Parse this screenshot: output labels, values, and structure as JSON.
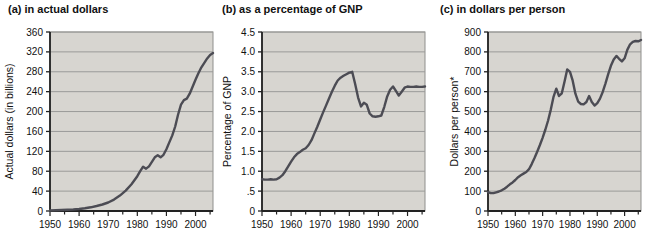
{
  "colors": {
    "page_bg": "#ffffff",
    "plot_bg": "#d7d5d0",
    "grid": "#9b9b99",
    "plot_border": "#8f8f8d",
    "axis": "#222222",
    "line": "#4c4c54",
    "text": "#111111"
  },
  "chart_data": [
    {
      "type": "line",
      "title": "(a) in actual dollars",
      "ylabel": "Actual dollars (in billions)",
      "xlabel": "",
      "ylim": [
        0,
        360
      ],
      "y_ticks": [
        0,
        40,
        80,
        120,
        160,
        200,
        240,
        280,
        320,
        360
      ],
      "y_tick_labels": [
        "0",
        "40",
        "80",
        "120",
        "160",
        "200",
        "240",
        "280",
        "320",
        "360"
      ],
      "x_domain": [
        1950,
        2006
      ],
      "x_tick_minor_step": 5,
      "x_tick_labels": [
        "1950",
        "1960",
        "1970",
        "1980",
        "1990",
        "2000"
      ],
      "grid": "horizontal",
      "legend": "none",
      "points": [
        [
          1950,
          1
        ],
        [
          1952,
          1.5
        ],
        [
          1954,
          2
        ],
        [
          1956,
          2.5
        ],
        [
          1958,
          3
        ],
        [
          1960,
          4
        ],
        [
          1962,
          5.5
        ],
        [
          1964,
          7.5
        ],
        [
          1966,
          10
        ],
        [
          1968,
          13
        ],
        [
          1970,
          17
        ],
        [
          1972,
          23
        ],
        [
          1974,
          31
        ],
        [
          1976,
          41
        ],
        [
          1978,
          54
        ],
        [
          1980,
          70
        ],
        [
          1981,
          80
        ],
        [
          1982,
          89
        ],
        [
          1983,
          85
        ],
        [
          1984,
          90
        ],
        [
          1985,
          99
        ],
        [
          1986,
          108
        ],
        [
          1987,
          112
        ],
        [
          1988,
          108
        ],
        [
          1989,
          113
        ],
        [
          1990,
          124
        ],
        [
          1991,
          138
        ],
        [
          1992,
          152
        ],
        [
          1993,
          170
        ],
        [
          1994,
          194
        ],
        [
          1995,
          214
        ],
        [
          1996,
          223
        ],
        [
          1997,
          226
        ],
        [
          1998,
          236
        ],
        [
          1999,
          250
        ],
        [
          2000,
          264
        ],
        [
          2001,
          277
        ],
        [
          2002,
          289
        ],
        [
          2003,
          298
        ],
        [
          2004,
          307
        ],
        [
          2005,
          314
        ],
        [
          2006,
          318
        ]
      ]
    },
    {
      "type": "line",
      "title": "(b) as a percentage of GNP",
      "ylabel": "Percentage of GNP",
      "xlabel": "",
      "ylim": [
        0,
        4.5
      ],
      "y_ticks": [
        0,
        0.5,
        1.0,
        1.5,
        2.0,
        2.5,
        3.0,
        3.5,
        4.0,
        4.5
      ],
      "y_tick_labels": [
        "0",
        ".5",
        "1.0",
        "1.5",
        "2.0",
        "2.5",
        "3.0",
        "3.5",
        "4.0",
        "4.5"
      ],
      "x_domain": [
        1950,
        2006
      ],
      "x_tick_minor_step": 5,
      "x_tick_labels": [
        "1950",
        "1960",
        "1970",
        "1980",
        "1990",
        "2000"
      ],
      "grid": "horizontal",
      "legend": "none",
      "points": [
        [
          1950,
          0.8
        ],
        [
          1951,
          0.79
        ],
        [
          1952,
          0.79
        ],
        [
          1953,
          0.8
        ],
        [
          1954,
          0.79
        ],
        [
          1955,
          0.8
        ],
        [
          1956,
          0.84
        ],
        [
          1957,
          0.9
        ],
        [
          1958,
          1.0
        ],
        [
          1959,
          1.12
        ],
        [
          1960,
          1.24
        ],
        [
          1961,
          1.35
        ],
        [
          1962,
          1.43
        ],
        [
          1963,
          1.48
        ],
        [
          1964,
          1.54
        ],
        [
          1965,
          1.58
        ],
        [
          1966,
          1.66
        ],
        [
          1967,
          1.78
        ],
        [
          1968,
          1.95
        ],
        [
          1969,
          2.12
        ],
        [
          1970,
          2.3
        ],
        [
          1971,
          2.48
        ],
        [
          1972,
          2.65
        ],
        [
          1973,
          2.82
        ],
        [
          1974,
          3.0
        ],
        [
          1975,
          3.15
        ],
        [
          1976,
          3.28
        ],
        [
          1977,
          3.35
        ],
        [
          1978,
          3.4
        ],
        [
          1979,
          3.44
        ],
        [
          1980,
          3.48
        ],
        [
          1981,
          3.5
        ],
        [
          1982,
          3.2
        ],
        [
          1983,
          2.85
        ],
        [
          1984,
          2.63
        ],
        [
          1985,
          2.72
        ],
        [
          1986,
          2.67
        ],
        [
          1987,
          2.45
        ],
        [
          1988,
          2.38
        ],
        [
          1989,
          2.37
        ],
        [
          1990,
          2.38
        ],
        [
          1991,
          2.4
        ],
        [
          1992,
          2.62
        ],
        [
          1993,
          2.88
        ],
        [
          1994,
          3.05
        ],
        [
          1995,
          3.13
        ],
        [
          1996,
          3.02
        ],
        [
          1997,
          2.9
        ],
        [
          1998,
          3.0
        ],
        [
          1999,
          3.1
        ],
        [
          2000,
          3.13
        ],
        [
          2001,
          3.12
        ],
        [
          2002,
          3.12
        ],
        [
          2003,
          3.13
        ],
        [
          2004,
          3.12
        ],
        [
          2005,
          3.12
        ],
        [
          2006,
          3.13
        ]
      ]
    },
    {
      "type": "line",
      "title": "(c) in dollars per person",
      "ylabel": "Dollars per person*",
      "xlabel": "",
      "ylim": [
        0,
        900
      ],
      "y_ticks": [
        0,
        100,
        200,
        300,
        400,
        500,
        600,
        700,
        800,
        900
      ],
      "y_tick_labels": [
        "0",
        "100",
        "200",
        "300",
        "400",
        "500",
        "600",
        "700",
        "800",
        "900"
      ],
      "x_domain": [
        1950,
        2006
      ],
      "x_tick_minor_step": 5,
      "x_tick_labels": [
        "1950",
        "1960",
        "1970",
        "1980",
        "1990",
        "2000"
      ],
      "grid": "horizontal",
      "legend": "none",
      "points": [
        [
          1950,
          95
        ],
        [
          1951,
          90
        ],
        [
          1952,
          90
        ],
        [
          1953,
          94
        ],
        [
          1954,
          98
        ],
        [
          1955,
          104
        ],
        [
          1956,
          112
        ],
        [
          1957,
          122
        ],
        [
          1958,
          134
        ],
        [
          1959,
          144
        ],
        [
          1960,
          156
        ],
        [
          1961,
          170
        ],
        [
          1962,
          180
        ],
        [
          1963,
          188
        ],
        [
          1964,
          196
        ],
        [
          1965,
          210
        ],
        [
          1966,
          236
        ],
        [
          1967,
          265
        ],
        [
          1968,
          298
        ],
        [
          1969,
          332
        ],
        [
          1970,
          368
        ],
        [
          1971,
          410
        ],
        [
          1972,
          455
        ],
        [
          1973,
          510
        ],
        [
          1974,
          575
        ],
        [
          1975,
          615
        ],
        [
          1976,
          578
        ],
        [
          1977,
          592
        ],
        [
          1978,
          650
        ],
        [
          1979,
          712
        ],
        [
          1980,
          700
        ],
        [
          1981,
          655
        ],
        [
          1982,
          590
        ],
        [
          1983,
          550
        ],
        [
          1984,
          538
        ],
        [
          1985,
          536
        ],
        [
          1986,
          548
        ],
        [
          1987,
          578
        ],
        [
          1988,
          548
        ],
        [
          1989,
          530
        ],
        [
          1990,
          542
        ],
        [
          1991,
          565
        ],
        [
          1992,
          600
        ],
        [
          1993,
          642
        ],
        [
          1994,
          688
        ],
        [
          1995,
          730
        ],
        [
          1996,
          762
        ],
        [
          1997,
          780
        ],
        [
          1998,
          765
        ],
        [
          1999,
          752
        ],
        [
          2000,
          768
        ],
        [
          2001,
          810
        ],
        [
          2002,
          838
        ],
        [
          2003,
          850
        ],
        [
          2004,
          855
        ],
        [
          2005,
          853
        ],
        [
          2006,
          860
        ]
      ]
    }
  ]
}
